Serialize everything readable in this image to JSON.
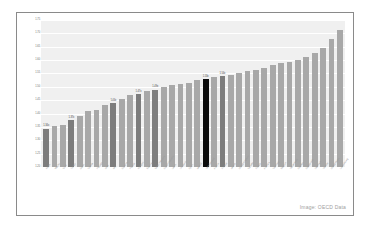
{
  "credit": "Image: OECD Data",
  "chart_data": {
    "type": "bar",
    "title": "",
    "subtitle": "",
    "xlabel": "",
    "ylabel": "",
    "ylim": [
      1.2,
      1.75
    ],
    "grid": true,
    "legend": "none",
    "ytick_labels": [
      "1.75",
      "1.70",
      "1.65",
      "1.60",
      "1.55",
      "1.50",
      "1.45",
      "1.40",
      "1.35",
      "1.30",
      "1.25",
      "1.20"
    ],
    "ytick_values": [
      1.75,
      1.7,
      1.65,
      1.6,
      1.55,
      1.5,
      1.45,
      1.4,
      1.35,
      1.3,
      1.25,
      1.2
    ],
    "categories": [
      "Korea",
      "Mexico",
      "Chile",
      "Turkey",
      "Japan",
      "Greece",
      "Portugal",
      "Israel",
      "Italy",
      "Slovenia",
      "Poland",
      "Hungary",
      "Estonia",
      "Czech Republic",
      "Slovak Republic",
      "Latvia",
      "Lithuania",
      "Spain",
      "Iceland",
      "New Zealand",
      "Austria",
      "Finland",
      "Ireland",
      "United Kingdom",
      "Canada",
      "France",
      "Australia",
      "Germany",
      "Belgium",
      "Netherlands",
      "Sweden",
      "Switzerland",
      "Denmark",
      "Norway",
      "United States",
      "Luxembourg"
    ],
    "values": [
      1.344,
      1.352,
      1.356,
      1.375,
      1.392,
      1.408,
      1.412,
      1.432,
      1.441,
      1.455,
      1.468,
      1.472,
      1.483,
      1.49,
      1.498,
      1.506,
      1.512,
      1.516,
      1.524,
      1.53,
      1.536,
      1.54,
      1.546,
      1.552,
      1.558,
      1.564,
      1.572,
      1.58,
      1.588,
      1.594,
      1.602,
      1.612,
      1.628,
      1.644,
      1.678,
      1.712
    ],
    "bar_styles": [
      "dark",
      "light",
      "light",
      "dark",
      "light",
      "light",
      "light",
      "light",
      "dark",
      "light",
      "light",
      "dark",
      "light",
      "dark",
      "light",
      "light",
      "light",
      "light",
      "light",
      "black",
      "light",
      "dark",
      "light",
      "light",
      "light",
      "light",
      "light",
      "light",
      "light",
      "light",
      "light",
      "light",
      "light",
      "light",
      "light",
      "light"
    ],
    "data_labels": [
      {
        "index": 0,
        "text": "1.34x"
      },
      {
        "index": 3,
        "text": "1.37x"
      },
      {
        "index": 8,
        "text": "1.44x"
      },
      {
        "index": 11,
        "text": "1.47x"
      },
      {
        "index": 13,
        "text": "1.49x"
      },
      {
        "index": 19,
        "text": "1.53x"
      },
      {
        "index": 21,
        "text": "1.54x"
      }
    ],
    "colors": {
      "bar_light": "#a8a8a8",
      "bar_dark": "#7d7d7d",
      "bar_highlight": "#0d0d0d",
      "plot_background": "#f0f0f0",
      "gridline": "#ffffff",
      "axis_text": "#6d6d6d",
      "frame_border": "#8a8a8a"
    }
  }
}
